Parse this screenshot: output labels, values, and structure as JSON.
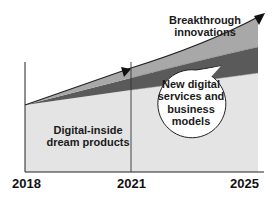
{
  "diagram": {
    "type": "stacked-growth-area",
    "layers": [
      {
        "id": "digital-inside",
        "label": "Digital-inside dream products",
        "color": "#e4e4e4"
      },
      {
        "id": "services",
        "label": "New digital services and business models",
        "color": "#5a5a5a"
      },
      {
        "id": "breakthrough",
        "label": "Breakthrough innovations",
        "color": "#a8a8a8"
      }
    ],
    "labels": {
      "breakthrough": "Breakthrough innovations",
      "digital_inside": "Digital-inside dream products",
      "services": "New digital services and business models"
    },
    "x_axis": {
      "ticks": [
        "2018",
        "2021",
        "2025"
      ]
    },
    "colors": {
      "axis": "#222222",
      "light_area": "#e4e4e4",
      "dark_band": "#5a5a5a",
      "mid_band": "#a8a8a8",
      "bubble_fill": "#ffffff",
      "bubble_stroke": "#222222"
    }
  }
}
